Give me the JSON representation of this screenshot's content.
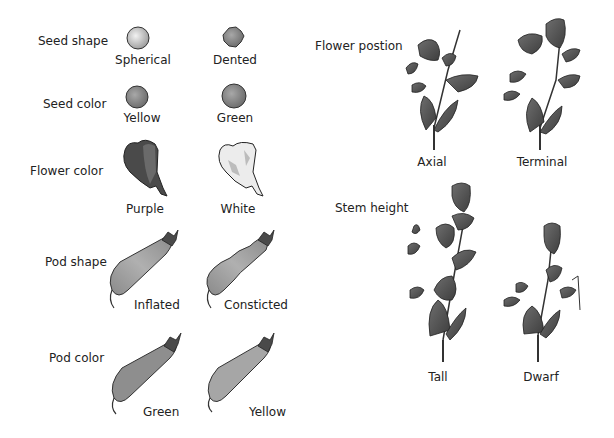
{
  "traits": [
    {
      "name": "Seed shape",
      "variants": [
        "Spherical",
        "Dented"
      ]
    },
    {
      "name": "Seed color",
      "variants": [
        "Yellow",
        "Green"
      ]
    },
    {
      "name": "Flower color",
      "variants": [
        "Purple",
        "White"
      ]
    },
    {
      "name": "Pod shape",
      "variants": [
        "Inflated",
        "Consticted"
      ]
    },
    {
      "name": "Pod color",
      "variants": [
        "Green",
        "Yellow"
      ]
    },
    {
      "name": "Flower postion",
      "variants": [
        "Axial",
        "Terminal"
      ]
    },
    {
      "name": "Stem height",
      "variants": [
        "Tall",
        "Dwarf"
      ]
    }
  ],
  "colors": {
    "background": "#ffffff",
    "outline": "#222222",
    "fill_dark": "#5a5a5a",
    "fill_mid": "#8a8a8a",
    "fill_light": "#cfcfcf"
  }
}
